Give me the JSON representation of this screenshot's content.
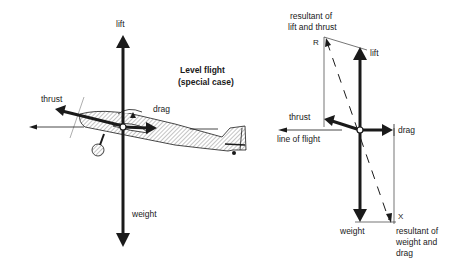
{
  "left_diagram": {
    "title_line1": "Level flight",
    "title_line2": "(special case)",
    "labels": {
      "lift": "lift",
      "thrust": "thrust",
      "drag": "drag",
      "weight": "weight"
    }
  },
  "right_diagram": {
    "labels": {
      "resultant_lift_thrust_line1": "resultant of",
      "resultant_lift_thrust_line2": "lift and thrust",
      "point_r": "R",
      "lift": "lift",
      "thrust": "thrust",
      "drag": "drag",
      "line_of_flight": "line of flight",
      "weight": "weight",
      "point_x": "X",
      "resultant_weight_drag_line1": "resultant of",
      "resultant_weight_drag_line2": "weight and",
      "resultant_weight_drag_line3": "drag"
    }
  },
  "colors": {
    "ink": "#1a1a1a",
    "background": "#ffffff",
    "hatch": "#9a9a9a"
  }
}
